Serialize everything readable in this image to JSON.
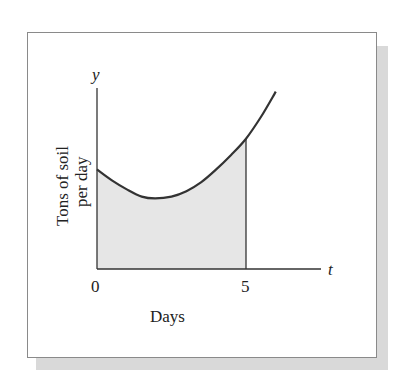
{
  "chart_data": {
    "type": "area",
    "title": "",
    "xlabel": "Days",
    "ylabel": "Tons of soil per day",
    "ylabel_lines": [
      "Tons of soil",
      "per day"
    ],
    "x_axis_symbol": "t",
    "y_axis_symbol": "y",
    "x_ticks": [
      "0",
      "5"
    ],
    "y_ticks": [],
    "grid": false,
    "legend": null,
    "series": [
      {
        "name": "soil rate",
        "x": [
          0,
          0.5,
          1,
          1.5,
          1.95,
          2.5,
          3,
          3.5,
          4,
          4.5,
          5,
          5.5,
          6
        ],
        "values": [
          5.5,
          4.9,
          4.4,
          4.0,
          3.9,
          4.0,
          4.3,
          4.8,
          5.5,
          6.3,
          7.2,
          8.4,
          9.8
        ]
      }
    ],
    "shaded_region": {
      "from_x": 0,
      "to_x": 5,
      "fill": "#e6e6e6"
    },
    "xlim": [
      0,
      7.5
    ],
    "ylim": [
      0,
      10
    ]
  },
  "labels": {
    "y_symbol": "y",
    "t_symbol": "t",
    "tick_0": "0",
    "tick_5": "5",
    "xlabel": "Days",
    "ylabel_line1": "Tons of soil",
    "ylabel_line2": "per day"
  },
  "colors": {
    "curve": "#333333",
    "axis": "#333333",
    "shade": "#e6e6e6",
    "frame_shadow": "#d9d9d9"
  }
}
